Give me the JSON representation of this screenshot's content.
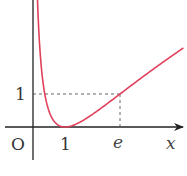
{
  "chart_data": {
    "type": "line",
    "title": "",
    "function": "y = (ln x)^2",
    "xlabel": "x",
    "ylabel": "",
    "origin_label": "O",
    "x_ticks": [
      {
        "value": 1,
        "label": "1"
      },
      {
        "value": 2.718,
        "label": "e"
      }
    ],
    "y_ticks": [
      {
        "value": 1,
        "label": "1"
      }
    ],
    "guide_lines": [
      {
        "from": [
          0,
          1
        ],
        "to": [
          2.718,
          1
        ],
        "style": "dashed"
      },
      {
        "from": [
          2.718,
          0
        ],
        "to": [
          2.718,
          1
        ],
        "style": "dashed"
      }
    ],
    "series": [
      {
        "name": "curve",
        "color": "#e0405a",
        "x": [
          0.15,
          0.2,
          0.3,
          0.4,
          0.5,
          0.6,
          0.7,
          0.8,
          0.9,
          1.0,
          1.2,
          1.5,
          2.0,
          2.5,
          2.718,
          3.0,
          3.5,
          4.0,
          4.5
        ],
        "y": [
          3.6,
          2.59,
          1.45,
          0.84,
          0.48,
          0.26,
          0.13,
          0.05,
          0.01,
          0.0,
          0.03,
          0.16,
          0.48,
          0.84,
          1.0,
          1.21,
          1.57,
          1.92,
          2.26
        ]
      }
    ],
    "xlim": [
      -1,
      4.7
    ],
    "ylim": [
      -1.5,
      3.8
    ],
    "grid": false,
    "axis_color": "#222222"
  }
}
